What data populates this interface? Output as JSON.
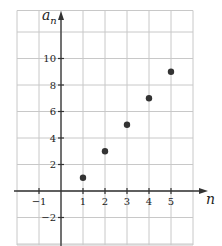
{
  "chart_data": {
    "type": "scatter",
    "title": "",
    "xlabel": "n",
    "ylabel": "a_n",
    "ylabel_display": {
      "base": "a",
      "sub": "n"
    },
    "xlim": [
      -2,
      6
    ],
    "ylim": [
      -4,
      14
    ],
    "grid": true,
    "x_ticks": [
      -1,
      1,
      2,
      3,
      4,
      5
    ],
    "y_ticks": [
      -2,
      2,
      4,
      6,
      8,
      10
    ],
    "series": [
      {
        "name": "a_n",
        "points": [
          {
            "x": 1,
            "y": 1
          },
          {
            "x": 2,
            "y": 3
          },
          {
            "x": 3,
            "y": 5
          },
          {
            "x": 4,
            "y": 7
          },
          {
            "x": 5,
            "y": 9
          }
        ],
        "color": "#333333"
      }
    ],
    "colors": {
      "grid": "#c8c8c8",
      "axis": "#333333",
      "point": "#333333"
    }
  }
}
